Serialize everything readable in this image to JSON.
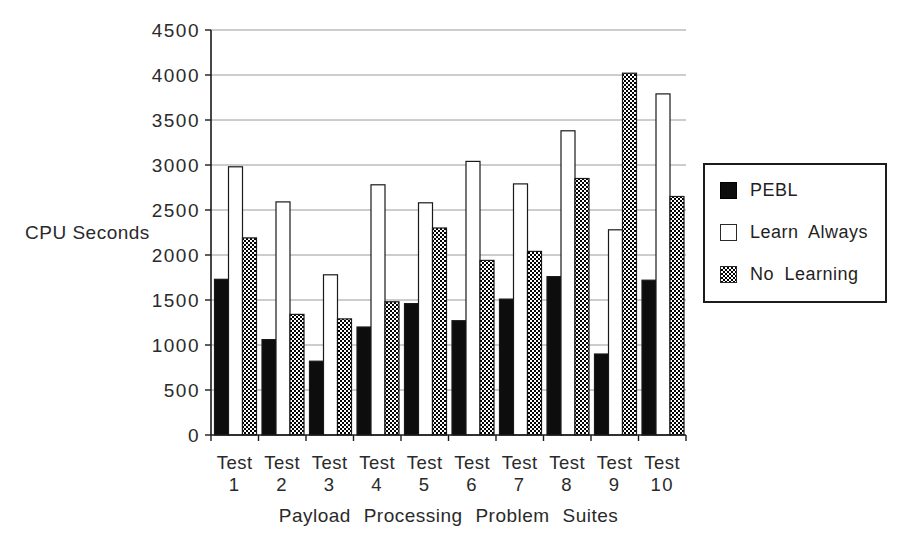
{
  "chart_data": {
    "type": "bar",
    "title": "",
    "ylabel": "CPU Seconds",
    "xlabel": "Payload Processing Problem Suites",
    "ylim": [
      0,
      4500
    ],
    "yticks": [
      0,
      500,
      1000,
      1500,
      2000,
      2500,
      3000,
      3500,
      4000,
      4500
    ],
    "grid": true,
    "legend_position": "right-outside",
    "category_prefix": "Test",
    "categories": [
      "1",
      "2",
      "3",
      "4",
      "5",
      "6",
      "7",
      "8",
      "9",
      "10"
    ],
    "series": [
      {
        "name": "PEBL",
        "fill_style": "solid-black",
        "values": [
          1730,
          1060,
          820,
          1200,
          1460,
          1270,
          1510,
          1760,
          900,
          1720
        ]
      },
      {
        "name": "Learn Always",
        "fill_style": "white-outline",
        "values": [
          2980,
          2590,
          1780,
          2780,
          2580,
          3040,
          2790,
          3380,
          2280,
          3790
        ]
      },
      {
        "name": "No Learning",
        "fill_style": "checkerboard",
        "values": [
          2190,
          1340,
          1290,
          1480,
          2300,
          1940,
          2040,
          2850,
          4020,
          2650
        ]
      }
    ]
  },
  "colors": {
    "background": "#ffffff",
    "axis": "#1a1a1a",
    "gridline": "#9a9a9a",
    "text": "#2a2a2a",
    "bar_outline": "#1a1a1a",
    "pebl_fill": "#0d0d0d",
    "learn_always_fill": "#ffffff",
    "no_learning_fill": "#000000 on #ffffff checkerboard"
  }
}
